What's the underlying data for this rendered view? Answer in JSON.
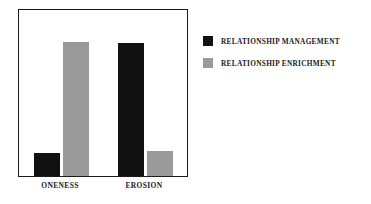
{
  "chart_data": {
    "type": "bar",
    "title": "",
    "subtitle": "",
    "xlabel": "",
    "ylabel": "",
    "categories": [
      "ONENESS",
      "EROSION"
    ],
    "series": [
      {
        "name": "RELATIONSHIP MANAGEMENT",
        "color": "#111111",
        "values": [
          14,
          80
        ]
      },
      {
        "name": "RELATIONSHIP ENRICHMENT",
        "color": "#9a9a9a",
        "values": [
          81,
          15
        ]
      }
    ],
    "ylim": [
      0,
      100
    ],
    "grid": false,
    "axis_visible": true,
    "legend_position": "right",
    "annotations": []
  },
  "legend": {
    "entries": [
      {
        "label": "RELATIONSHIP MANAGEMENT",
        "swatch": "black-swatch"
      },
      {
        "label": "RELATIONSHIP ENRICHMENT",
        "swatch": "gray-swatch"
      }
    ]
  },
  "axis": {
    "tick_labels": [
      "ONENESS",
      "EROSION"
    ]
  },
  "colors": {
    "background": "#ffffff",
    "frame": "#1b1b1b",
    "series_0": "#111111",
    "series_1": "#9a9a9a",
    "text": "#1b1b1b"
  }
}
